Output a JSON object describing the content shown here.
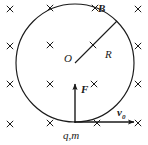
{
  "figure": {
    "background_color": "#ffffff",
    "stroke_color": "#1a1a1a",
    "width": 148,
    "height": 145
  },
  "labels": {
    "field_label": "B",
    "center_label": "O",
    "radius_label": "R",
    "force_label": "F",
    "velocity_label": "v",
    "velocity_subscript": "0",
    "particle_label": "q,m"
  },
  "geometry": {
    "circle": {
      "cx": 75,
      "cy": 63,
      "r": 59
    },
    "center_dot": {
      "cx": 75,
      "cy": 63
    },
    "radius_line": {
      "x1": 75,
      "y1": 63,
      "x2": 117,
      "y2": 21
    },
    "force_arrow": {
      "x1": 75,
      "y1": 122,
      "x2": 75,
      "y2": 84
    },
    "velocity_arrow": {
      "x1": 75,
      "y1": 122,
      "x2": 134,
      "y2": 122
    },
    "particle_point": {
      "cx": 75,
      "cy": 122
    }
  },
  "field_markers": {
    "symbol": "×",
    "meaning": "magnetic field into the page",
    "positions": [
      {
        "x": 10,
        "y": 9
      },
      {
        "x": 50,
        "y": 8
      },
      {
        "x": 95,
        "y": 8
      },
      {
        "x": 138,
        "y": 9
      },
      {
        "x": 10,
        "y": 46
      },
      {
        "x": 50,
        "y": 45
      },
      {
        "x": 93,
        "y": 45
      },
      {
        "x": 138,
        "y": 46
      },
      {
        "x": 10,
        "y": 84
      },
      {
        "x": 50,
        "y": 84
      },
      {
        "x": 94,
        "y": 84
      },
      {
        "x": 138,
        "y": 84
      },
      {
        "x": 10,
        "y": 124
      },
      {
        "x": 50,
        "y": 123
      },
      {
        "x": 97,
        "y": 123
      },
      {
        "x": 138,
        "y": 123
      }
    ]
  }
}
